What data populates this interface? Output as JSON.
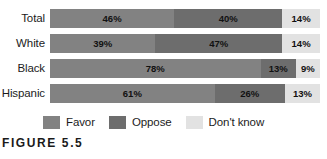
{
  "clipped_title": "",
  "caption": "FIGURE 5.5",
  "legend": {
    "position": "bottom",
    "items": [
      {
        "label": "Favor",
        "color": "#828282",
        "swatch": "favor-swatch"
      },
      {
        "label": "Oppose",
        "color": "#6d6d6d",
        "swatch": "oppose-swatch"
      },
      {
        "label": "Don't know",
        "color": "#e2e2e2",
        "swatch": "dont-know-swatch"
      }
    ]
  },
  "rows": [
    {
      "label": "Total",
      "segments": [
        {
          "name": "Favor",
          "value": 46,
          "text": "46%"
        },
        {
          "name": "Oppose",
          "value": 40,
          "text": "40%"
        },
        {
          "name": "Don't know",
          "value": 14,
          "text": "14%"
        }
      ]
    },
    {
      "label": "White",
      "segments": [
        {
          "name": "Favor",
          "value": 39,
          "text": "39%"
        },
        {
          "name": "Oppose",
          "value": 47,
          "text": "47%"
        },
        {
          "name": "Don't know",
          "value": 14,
          "text": "14%"
        }
      ]
    },
    {
      "label": "Black",
      "segments": [
        {
          "name": "Favor",
          "value": 78,
          "text": "78%"
        },
        {
          "name": "Oppose",
          "value": 13,
          "text": "13%"
        },
        {
          "name": "Don't know",
          "value": 9,
          "text": "9%"
        }
      ]
    },
    {
      "label": "Hispanic",
      "segments": [
        {
          "name": "Favor",
          "value": 61,
          "text": "61%"
        },
        {
          "name": "Oppose",
          "value": 26,
          "text": "26%"
        },
        {
          "name": "Don't know",
          "value": 13,
          "text": "13%"
        }
      ]
    }
  ],
  "chart_data": {
    "type": "bar",
    "orientation": "horizontal",
    "stacked": true,
    "normalized_percent": true,
    "title": "",
    "xlabel": "",
    "ylabel": "",
    "xlim": [
      0,
      100
    ],
    "grid": false,
    "legend_position": "bottom",
    "categories": [
      "Total",
      "White",
      "Black",
      "Hispanic"
    ],
    "series": [
      {
        "name": "Favor",
        "color": "#828282",
        "values": [
          46,
          39,
          78,
          61
        ]
      },
      {
        "name": "Oppose",
        "color": "#6d6d6d",
        "values": [
          40,
          47,
          13,
          26
        ]
      },
      {
        "name": "Don't know",
        "color": "#e2e2e2",
        "values": [
          14,
          14,
          9,
          13
        ]
      }
    ],
    "data_labels": [
      [
        "46%",
        "40%",
        "14%"
      ],
      [
        "39%",
        "47%",
        "14%"
      ],
      [
        "78%",
        "13%",
        "9%"
      ],
      [
        "61%",
        "26%",
        "13%"
      ]
    ],
    "annotations": [
      "FIGURE 5.5"
    ]
  }
}
